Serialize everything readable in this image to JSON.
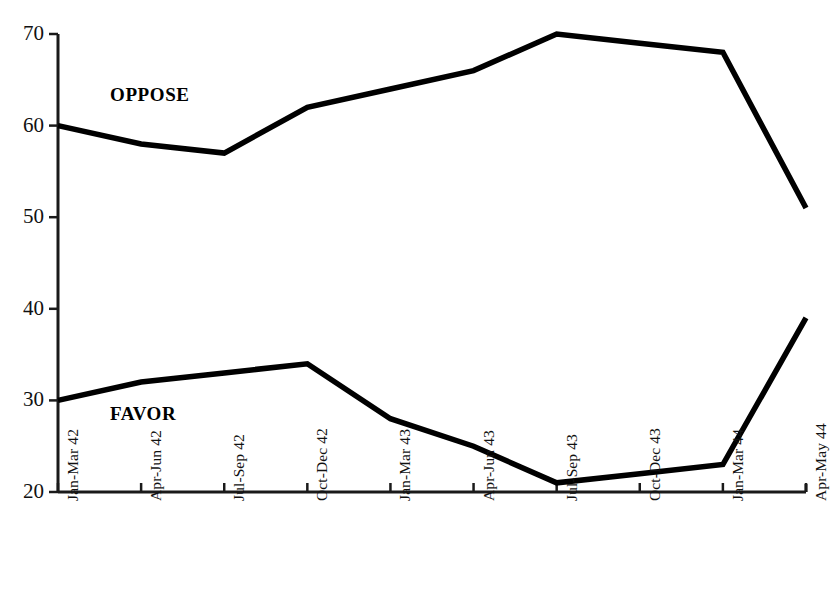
{
  "chart_data": {
    "type": "line",
    "title": "",
    "subtitle": "",
    "xlabel": "",
    "ylabel": "",
    "categories": [
      "Jan-Mar 42",
      "Apr-Jun 42",
      "Jul-Sep 42",
      "Oct-Dec 42",
      "Jan-Mar 43",
      "Apr-Jun 43",
      "Jul-Sep 43",
      "Oct-Dec 43",
      "Jan-Mar 44",
      "Apr-May 44"
    ],
    "series": [
      {
        "name": "OPPOSE",
        "values": [
          60,
          58,
          57,
          62,
          64,
          66,
          70,
          69,
          68,
          51
        ],
        "color": "#000000"
      },
      {
        "name": "FAVOR",
        "values": [
          30,
          32,
          33,
          34,
          28,
          25,
          21,
          22,
          23,
          39
        ],
        "color": "#000000"
      }
    ],
    "ylim": [
      20,
      70
    ],
    "yticks": [
      20,
      30,
      40,
      50,
      60,
      70
    ],
    "ytick_labels": [
      "20",
      "30",
      "40",
      "50",
      "60",
      "70"
    ],
    "grid": false,
    "legend_position": "inline-annotations",
    "annotations": [
      {
        "text": "OPPOSE",
        "series": "OPPOSE"
      },
      {
        "text": "FAVOR",
        "series": "FAVOR"
      }
    ],
    "colors": {
      "line": "#000000",
      "axis": "#1a1a1a",
      "background": "#ffffff"
    }
  },
  "axis": {
    "y_labels": [
      "70",
      "60",
      "50",
      "40",
      "30",
      "20"
    ]
  },
  "annotations": {
    "oppose_label": "OPPOSE",
    "favor_label": "FAVOR"
  }
}
